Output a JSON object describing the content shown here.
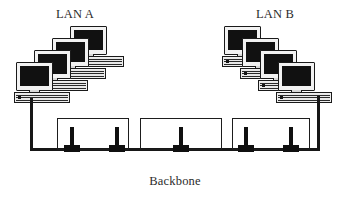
{
  "diagram": {
    "type": "network-topology",
    "background_color": "#ffffff",
    "line_color": "#171717",
    "text_color": "#2b2b2b"
  },
  "labels": {
    "lan_a": "LAN A",
    "lan_b": "LAN B",
    "backbone": "Backbone"
  },
  "lans": [
    {
      "id": "lan-a",
      "name": "LAN A",
      "workstation_count": 4,
      "cascade_direction": "up-right",
      "workstations": [
        {
          "index": 1,
          "x": 0,
          "y": 36
        },
        {
          "index": 2,
          "x": 18,
          "y": 24
        },
        {
          "index": 3,
          "x": 36,
          "y": 12
        },
        {
          "index": 4,
          "x": 54,
          "y": 0
        }
      ]
    },
    {
      "id": "lan-b",
      "name": "LAN B",
      "workstation_count": 4,
      "cascade_direction": "down-right",
      "workstations": [
        {
          "index": 1,
          "x": 0,
          "y": 0
        },
        {
          "index": 2,
          "x": 18,
          "y": 12
        },
        {
          "index": 3,
          "x": 36,
          "y": 24
        },
        {
          "index": 4,
          "x": 54,
          "y": 36
        }
      ]
    }
  ],
  "backbone": {
    "label": "Backbone",
    "segment_count": 3,
    "tap_count": 5,
    "segments": [
      {
        "index": 1,
        "taps": 2
      },
      {
        "index": 2,
        "taps": 1
      },
      {
        "index": 3,
        "taps": 2
      }
    ]
  },
  "icons": {
    "workstation": "computer-workstation-icon",
    "tap": "bus-tap-connector-icon"
  }
}
